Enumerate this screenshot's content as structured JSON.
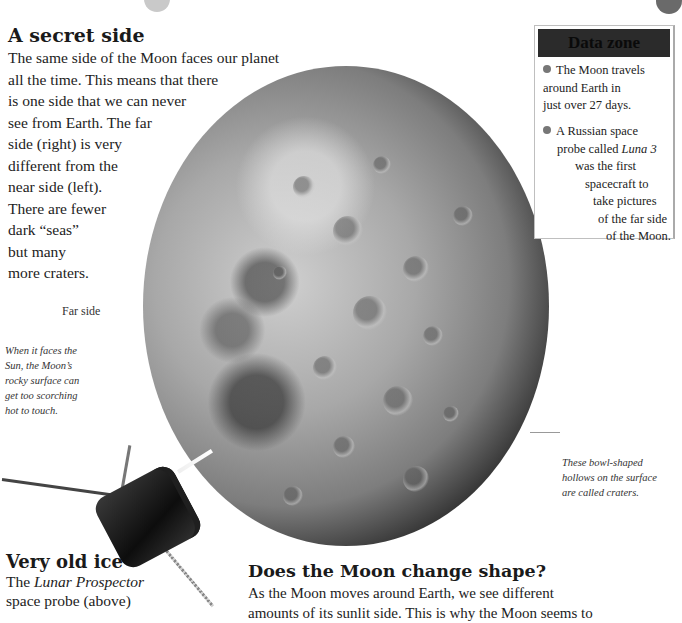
{
  "secret_side": {
    "heading": "A secret side",
    "lines": [
      "The same side of the Moon faces our planet",
      "all the time. This means that there",
      "is one side that we can never",
      "see from Earth. The far",
      "side (right) is very",
      "different from the",
      "near side (left).",
      "There are fewer",
      "dark “seas”",
      "but many",
      "more craters."
    ]
  },
  "labels": {
    "far_side": "Far side"
  },
  "captions": {
    "scorching": [
      "When it faces the",
      "Sun, the Moon’s",
      "rocky surface can",
      "get too scorching",
      "hot to touch."
    ],
    "craters": [
      "These bowl-shaped",
      "hollows on the surface",
      "are called craters."
    ]
  },
  "data_zone": {
    "title": "Data zone",
    "fact1": [
      "The Moon travels",
      "around Earth in",
      "just over 27 days."
    ],
    "fact2": {
      "line1": "A Russian space",
      "line2_pre": "probe called ",
      "line2_italic": "Luna 3",
      "line3": "was the first",
      "line4": "spacecraft to",
      "line5": "take pictures",
      "line6": "of the far side",
      "line7": "of the Moon."
    }
  },
  "very_old_ice": {
    "heading": "Very old ice",
    "line1_pre": "The ",
    "line1_italic": "Lunar Prospector",
    "line2": "space probe (above)"
  },
  "change_shape": {
    "heading": "Does the Moon change shape?",
    "line1": "As the Moon moves around Earth, we see different",
    "line2": "amounts of its sunlit side. This is why the Moon seems to"
  },
  "images": {
    "moon": "far-side-of-moon-photo",
    "probe": "lunar-prospector-probe"
  }
}
